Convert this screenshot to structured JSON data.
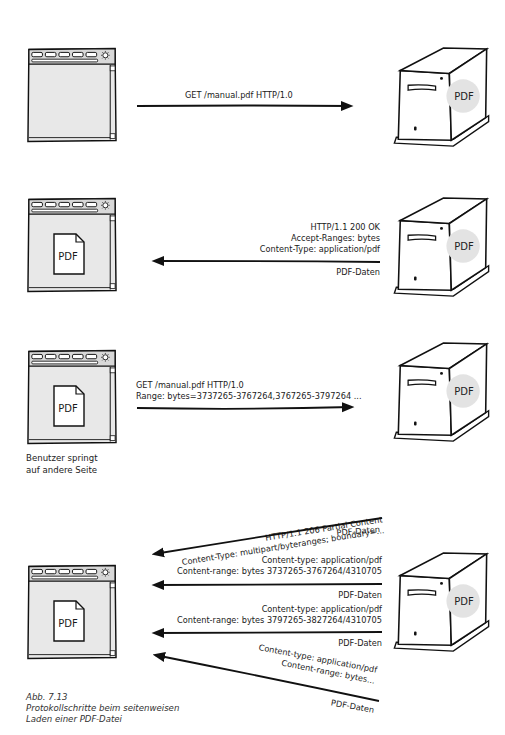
{
  "figure": {
    "caption_number": "Abb. 7.13",
    "caption_line1": "Protokollschritte beim seitenweisen",
    "caption_line2": "Laden einer PDF-Datei"
  },
  "colors": {
    "stroke": "#111111",
    "browser_fill": "#e8e8e8",
    "pdf_badge_fill": "#e3e3e3",
    "page_fill": "#ffffff"
  },
  "server_badge_label": "PDF",
  "document_icon_label": "PDF",
  "steps": [
    {
      "id": 1,
      "direction": "client-to-server",
      "lines": [
        "GET /manual.pdf  HTTP/1.0"
      ],
      "browser_shows_pdf": false
    },
    {
      "id": 2,
      "direction": "server-to-client",
      "header_lines": [
        "HTTP/1.1 200 OK",
        "Accept-Ranges: bytes",
        "Content-Type: application/pdf"
      ],
      "body_label": "PDF-Daten",
      "browser_shows_pdf": true
    },
    {
      "id": 3,
      "direction": "client-to-server",
      "lines": [
        "GET /manual.pdf  HTTP/1.0",
        "Range: bytes=3737265-3767264,3767265-3797264 ..."
      ],
      "browser_shows_pdf": true,
      "note_line1": "Benutzer springt",
      "note_line2": "auf andere Seite"
    },
    {
      "id": 4,
      "direction": "server-to-client",
      "browser_shows_pdf": true,
      "parts": [
        {
          "header_lines": [
            "HTTP/1.1 206 Partial Content",
            "Content-Type: multipart/byteranges; boundary=..."
          ],
          "body_label": "PDF-Daten"
        },
        {
          "header_lines": [
            "Content-type: application/pdf",
            "Content-range: bytes 3737265-3767264/4310705"
          ],
          "body_label": "PDF-Daten"
        },
        {
          "header_lines": [
            "Content-type: application/pdf",
            "Content-range: bytes 3797265-3827264/4310705"
          ],
          "body_label": "PDF-Daten"
        },
        {
          "header_lines": [
            "Content-type: application/pdf",
            "Content-range: bytes..."
          ],
          "body_label": "PDF-Daten"
        }
      ]
    }
  ]
}
